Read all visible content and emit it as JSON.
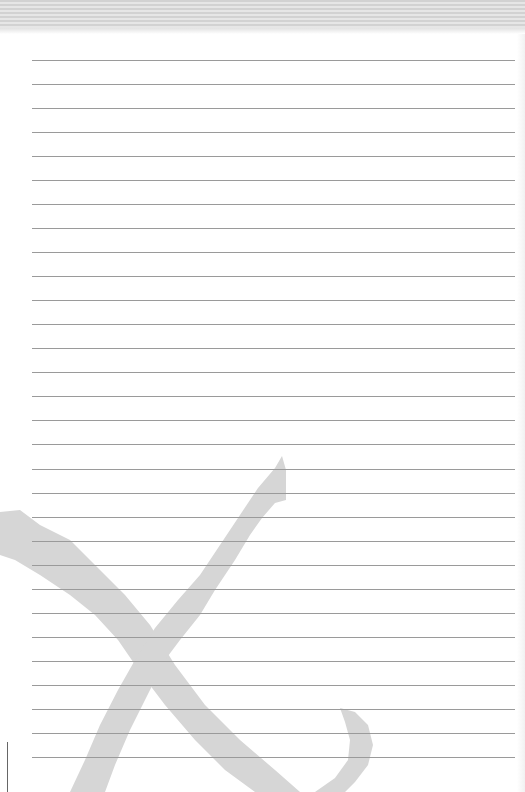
{
  "page": {
    "type": "lined-notepad",
    "line_count": 30,
    "first_line_y": 60,
    "line_spacing": 24.03,
    "line_color": "#9a9a9a",
    "header_stripe_color": "#d2d2d2",
    "watermark": {
      "icon": "x-mark-icon",
      "color": "#d9d9d9"
    }
  }
}
